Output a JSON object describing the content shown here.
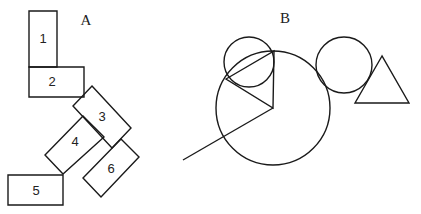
{
  "diagram_a": {
    "label": "A",
    "label_pos": [
      86,
      22
    ],
    "rectangles": [
      {
        "id": "1",
        "label": "1",
        "points": "29,11 57,11 57,67 29,67",
        "center": [
          43,
          40
        ]
      },
      {
        "id": "2",
        "label": "2",
        "points": "29,67 84,67 84,97 29,97",
        "center": [
          52,
          83
        ]
      },
      {
        "id": "3",
        "label": "3",
        "points": "92,86 131,128 112,148 73,106",
        "center": [
          102,
          118
        ]
      },
      {
        "id": "4",
        "label": "4",
        "points": "83,116 104,137 63,174 45,155",
        "center": [
          75,
          143
        ]
      },
      {
        "id": "5",
        "label": "5",
        "points": "8,175 63,175 63,205 8,205",
        "center": [
          36,
          192
        ]
      },
      {
        "id": "6",
        "label": "6",
        "points": "121,139 139,157 101,197 83,178",
        "center": [
          111,
          170
        ]
      }
    ]
  },
  "diagram_b": {
    "label": "B",
    "label_pos": [
      285,
      20
    ],
    "small_circle": {
      "cx": 249,
      "cy": 62,
      "r": 25
    },
    "big_circle": {
      "cx": 273,
      "cy": 108,
      "r": 57
    },
    "inner_triangle": "226,79 274,51 273,108",
    "line": {
      "x1": 273,
      "y1": 108,
      "x2": 183,
      "y2": 160
    },
    "right_circle": {
      "cx": 344,
      "cy": 65,
      "r": 28
    },
    "right_triangle": "382,56 355,103 409,103"
  }
}
